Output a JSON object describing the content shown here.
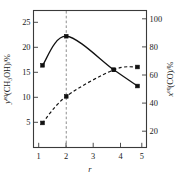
{
  "chart_data": {
    "type": "line",
    "title": "",
    "xlabel": "r",
    "xlim": [
      0.62,
      5.38
    ],
    "xticks": [
      1,
      2,
      3,
      4,
      5
    ],
    "xtick_labels": [
      "1",
      "2",
      "3",
      "4",
      "5"
    ],
    "grid": false,
    "legend": "none",
    "left_axis": {
      "label_main": "(CH",
      "label_sup": "eq",
      "label_var": "y",
      "label_sub": "3",
      "label_tail": "OH)/%",
      "full_label": "y^eq(CH3OH)/%",
      "ylim": [
        2.2,
        26.6
      ],
      "ticks": [
        5,
        10,
        15,
        20,
        25
      ],
      "tick_labels": [
        "5",
        "10",
        "15",
        "20",
        "25"
      ]
    },
    "right_axis": {
      "label_var": "x",
      "label_sup": "eq",
      "label_tail": "(CO)/%",
      "full_label": "x^eq(CO)/%",
      "ylim": [
        8.8,
        106.4
      ],
      "ticks": [
        20,
        40,
        60,
        80,
        100
      ],
      "tick_labels": [
        "20",
        "40",
        "60",
        "80",
        "100"
      ]
    },
    "series": [
      {
        "name": "methanol-equilibrium-mole-fraction",
        "style": "solid",
        "axis": "left",
        "x": [
          1,
          2,
          4,
          5
        ],
        "values": [
          16.8,
          22.0,
          16.0,
          13.1
        ],
        "markers": true,
        "curve": "smooth"
      },
      {
        "name": "co-equilibrium-conversion",
        "style": "dashed",
        "axis": "right",
        "x": [
          1,
          2,
          4,
          5
        ],
        "values": [
          26.0,
          45.0,
          64.0,
          66.0
        ],
        "markers": true,
        "curve": "smooth"
      }
    ],
    "annotations": [
      {
        "name": "optimum-ratio-reference-line",
        "type": "vertical-dashed-line",
        "x": 2
      }
    ]
  }
}
